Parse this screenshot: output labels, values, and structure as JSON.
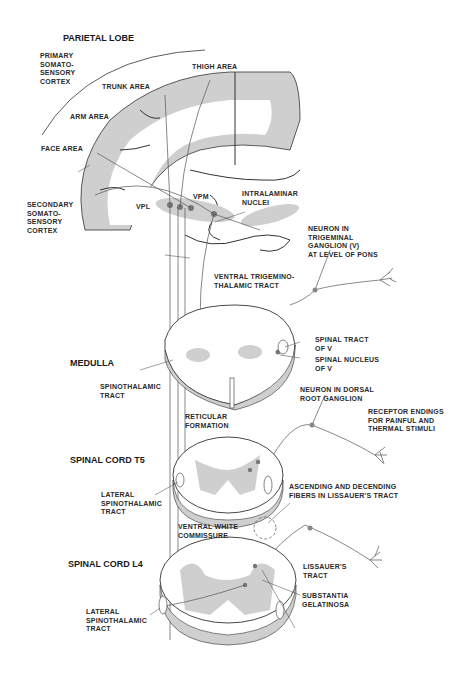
{
  "sections": {
    "parietal": "PARIETAL LOBE",
    "medulla": "MEDULLA",
    "t5": "SPINAL CORD T5",
    "l4": "SPINAL CORD L4"
  },
  "labels": {
    "primary_cortex": "PRIMARY\nSOMATO-\nSENSORY\nCORTEX",
    "thigh": "THIGH AREA",
    "trunk": "TRUNK AREA",
    "arm": "ARM AREA",
    "face": "FACE AREA",
    "secondary_cortex": "SECONDARY\nSOMATO-\nSENSORY\nCORTEX",
    "vpl": "VPL",
    "vpm": "VPM",
    "intralaminar": "INTRALAMINAR\nNUCLEI",
    "trigeminal_neuron": "NEURON IN\nTRIGEMINAL\nGANGLION (V)\nAT LEVEL OF PONS",
    "ventral_trig": "VENTRAL TRIGEMINO-\nTHALAMIC TRACT",
    "spinal_tract_v": "SPINAL TRACT\nOF V",
    "spinal_nucleus_v": "SPINAL NUCLEUS\nOF V",
    "spinothalamic": "SPINOTHALAMIC\nTRACT",
    "drg_neuron": "NEURON IN DORSAL\nROOT GANGLION",
    "receptor": "RECEPTOR ENDINGS\nFOR PAINFUL AND\nTHERMAL STIMULI",
    "reticular": "RETICULAR\nFORMATION",
    "lat_st_t5": "LATERAL\nSPINOTHALAMIC\nTRACT",
    "asc_desc": "ASCENDING AND DECENDING\nFIBERS IN LISSAUER'S TRACT",
    "vwc": "VENTRAL WHITE\nCOMMISSURE",
    "lissauer": "LISSAUER'S\nTRACT",
    "substantia": "SUBSTANTIA\nGELATINOSA",
    "lat_st_l4": "LATERAL\nSPINOTHALAMIC\nTRACT"
  },
  "colors": {
    "line": "#333333",
    "gray": "#c8c8c8",
    "dot": "#888888"
  }
}
